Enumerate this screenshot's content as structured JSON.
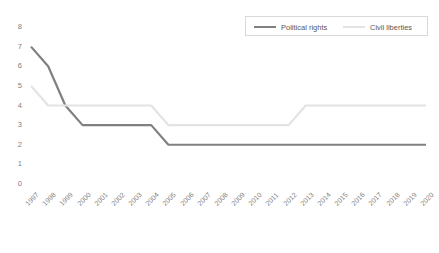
{
  "chart_data": {
    "type": "line",
    "title": "",
    "xlabel": "",
    "ylabel": "",
    "ylim": [
      0,
      8
    ],
    "yticks": [
      "0",
      "1",
      "2",
      "3",
      "4",
      "5",
      "6",
      "7",
      "8"
    ],
    "grid": false,
    "legend_position": "top-right",
    "categories": [
      "1997",
      "1998",
      "1999",
      "2000",
      "2001",
      "2002",
      "2003",
      "2004",
      "2005",
      "2006",
      "2007",
      "2008",
      "2009",
      "2010",
      "2011",
      "2012",
      "2013",
      "2014",
      "2015",
      "2016",
      "2017",
      "2018",
      "2019",
      "2020"
    ],
    "series": [
      {
        "name": "Political rights",
        "color": "#808080",
        "values": [
          7,
          6,
          4,
          3,
          3,
          3,
          3,
          3,
          2,
          2,
          2,
          2,
          2,
          2,
          2,
          2,
          2,
          2,
          2,
          2,
          2,
          2,
          2,
          2
        ]
      },
      {
        "name": "Civil liberties",
        "color": "#e3e3e3",
        "values": [
          5,
          4,
          4,
          4,
          4,
          4,
          4,
          4,
          3,
          3,
          3,
          3,
          3,
          3,
          3,
          3,
          4,
          4,
          4,
          4,
          4,
          4,
          4,
          4
        ]
      }
    ]
  },
  "legend": {
    "entries": [
      {
        "label": "Political rights"
      },
      {
        "label": "Civil liberties"
      }
    ]
  },
  "axes": {
    "y": {
      "labels": [
        "8",
        "7",
        "6",
        "5",
        "4",
        "3",
        "2",
        "1",
        "0"
      ]
    },
    "x": {
      "labels": [
        "1997",
        "1998",
        "1999",
        "2000",
        "2001",
        "2002",
        "2003",
        "2004",
        "2005",
        "2006",
        "2007",
        "2008",
        "2009",
        "2010",
        "2011",
        "2012",
        "2013",
        "2014",
        "2015",
        "2016",
        "2017",
        "2018",
        "2019",
        "2020"
      ]
    }
  }
}
